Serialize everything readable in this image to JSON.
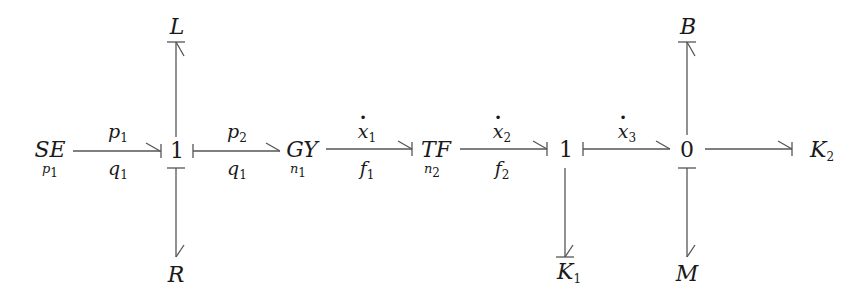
{
  "diagram": {
    "type": "bond-graph",
    "nodes": {
      "se": {
        "label": "SE",
        "sub": "p1"
      },
      "junction1a": {
        "label": "1"
      },
      "gy": {
        "label": "GY",
        "sub": "n1"
      },
      "tf": {
        "label": "TF",
        "sub": "n2"
      },
      "junction1b": {
        "label": "1"
      },
      "junction0": {
        "label": "0"
      },
      "L": {
        "label": "L"
      },
      "R": {
        "label": "R"
      },
      "K1": {
        "label": "K",
        "sub": "1"
      },
      "M": {
        "label": "M"
      },
      "B": {
        "label": "B"
      },
      "K2": {
        "label": "K",
        "sub": "2"
      }
    },
    "bonds": [
      {
        "from": "SE",
        "to": "1",
        "top": "p",
        "top_sub": "1",
        "bottom": "q",
        "bottom_sub": "1"
      },
      {
        "from": "1",
        "to": "GY",
        "top": "p",
        "top_sub": "2",
        "bottom": "q",
        "bottom_sub": "1"
      },
      {
        "from": "GY",
        "to": "TF",
        "top": "x",
        "top_sub": "1",
        "top_dot": true,
        "bottom": "f",
        "bottom_sub": "1"
      },
      {
        "from": "TF",
        "to": "1",
        "top": "x",
        "top_sub": "2",
        "top_dot": true,
        "bottom": "f",
        "bottom_sub": "2"
      },
      {
        "from": "1",
        "to": "0",
        "top": "x",
        "top_sub": "3",
        "top_dot": true
      },
      {
        "from": "0",
        "to": "K2"
      },
      {
        "from": "1",
        "to": "L"
      },
      {
        "from": "1",
        "to": "R"
      },
      {
        "from": "1",
        "to": "K1"
      },
      {
        "from": "0",
        "to": "B"
      },
      {
        "from": "0",
        "to": "M"
      }
    ]
  }
}
